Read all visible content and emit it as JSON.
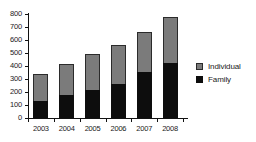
{
  "chart_data": {
    "type": "bar",
    "stacked": true,
    "title": "",
    "xlabel": "",
    "ylabel": "",
    "categories": [
      "2003",
      "2004",
      "2005",
      "2006",
      "2007",
      "2008"
    ],
    "series": [
      {
        "name": "Family",
        "color": "#0d0d0d",
        "values": [
          130,
          180,
          215,
          265,
          355,
          425
        ]
      },
      {
        "name": "Individual",
        "color": "#7b7b7b",
        "values": [
          210,
          235,
          280,
          295,
          310,
          355
        ]
      }
    ],
    "totals": [
      340,
      415,
      495,
      560,
      665,
      780
    ],
    "ylim": [
      0,
      800
    ],
    "yticks": [
      0,
      100,
      200,
      300,
      400,
      500,
      600,
      700,
      800
    ],
    "ytick_labels": [
      "0",
      "100",
      "200",
      "300",
      "400",
      "500",
      "600",
      "700",
      "800"
    ],
    "grid": false,
    "legend_position": "right",
    "legend": [
      {
        "label": "Individual",
        "color": "#7b7b7b"
      },
      {
        "label": "Family",
        "color": "#0d0d0d"
      }
    ]
  }
}
